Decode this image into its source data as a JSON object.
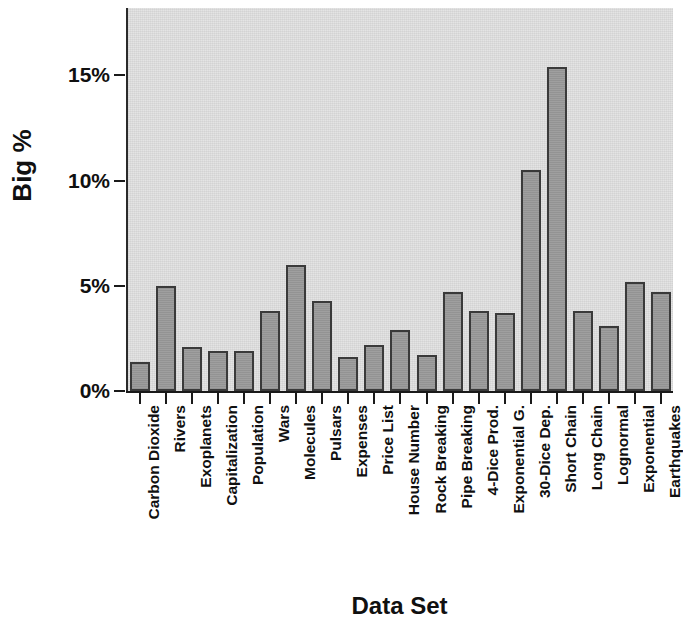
{
  "chart_data": {
    "type": "bar",
    "title": "",
    "xlabel": "Data Set",
    "ylabel": "Big %",
    "ylim": [
      0,
      18.2
    ],
    "ytick_values": [
      0,
      5,
      10,
      15
    ],
    "ytick_labels": [
      "0%",
      "5%",
      "10%",
      "15%"
    ],
    "grid": false,
    "legend": "none",
    "value_suffix": "%",
    "categories": [
      "Carbon Dioxide",
      "Rivers",
      "Exoplanets",
      "Capitalization",
      "Population",
      "Wars",
      "Molecules",
      "Pulsars",
      "Expenses",
      "Price List",
      "House Number",
      "Rock Breaking",
      "Pipe Breaking",
      "4-Dice Prod.",
      "Exponential G.",
      "30-Dice Dep.",
      "Short Chain",
      "Long Chain",
      "Lognormal",
      "Exponential",
      "Earthquakes"
    ],
    "values": [
      1.4,
      5.0,
      2.1,
      1.9,
      1.9,
      3.8,
      6.0,
      4.3,
      1.6,
      2.2,
      2.9,
      1.7,
      4.7,
      3.8,
      3.7,
      10.5,
      15.4,
      3.8,
      3.1,
      5.2,
      4.7
    ]
  },
  "axes": {
    "y_title": "Big %",
    "x_title": "Data Set"
  },
  "colors": {
    "bar_fill": "#9b9b9b",
    "bar_border": "#3a3a3a",
    "plot_background": "#e2e2e2",
    "axis": "#1a1a1a",
    "text": "#101010"
  }
}
